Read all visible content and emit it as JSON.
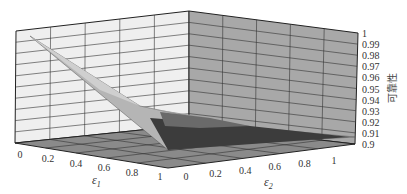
{
  "chart_data": {
    "type": "surface3d",
    "title": "",
    "xlabel": "ε1",
    "ylabel": "ε2",
    "zlabel": "可靠性",
    "xlim": [
      0,
      1
    ],
    "ylim": [
      0,
      1
    ],
    "zlim": [
      0.9,
      1
    ],
    "x_ticks": [
      "0",
      "0.2",
      "0.4",
      "0.6",
      "0.8",
      "1"
    ],
    "y_ticks": [
      "0",
      "0.2",
      "0.4",
      "0.6",
      "0.8",
      "1"
    ],
    "z_ticks": [
      "0.9",
      "0.91",
      "0.92",
      "0.93",
      "0.94",
      "0.95",
      "0.96",
      "0.97",
      "0.98",
      "0.99",
      "1"
    ],
    "grid": true,
    "surface": {
      "description": "Reliability decreases as ε1 and ε2 increase; maximum ≈1 at ε1=0, ε2=0, minimum ≈0.9 at ε1=1, ε2=1",
      "corners": [
        {
          "e1": 0,
          "e2": 0,
          "z": 0.995
        },
        {
          "e1": 1,
          "e2": 0,
          "z": 0.9
        },
        {
          "e1": 0,
          "e2": 1,
          "z": 0.9
        },
        {
          "e1": 1,
          "e2": 1,
          "z": 0.9
        }
      ]
    }
  },
  "axes": {
    "x_label_main": "ε",
    "x_label_sub": "1",
    "y_label_main": "ε",
    "y_label_sub": "2",
    "z_label": "可靠性"
  }
}
